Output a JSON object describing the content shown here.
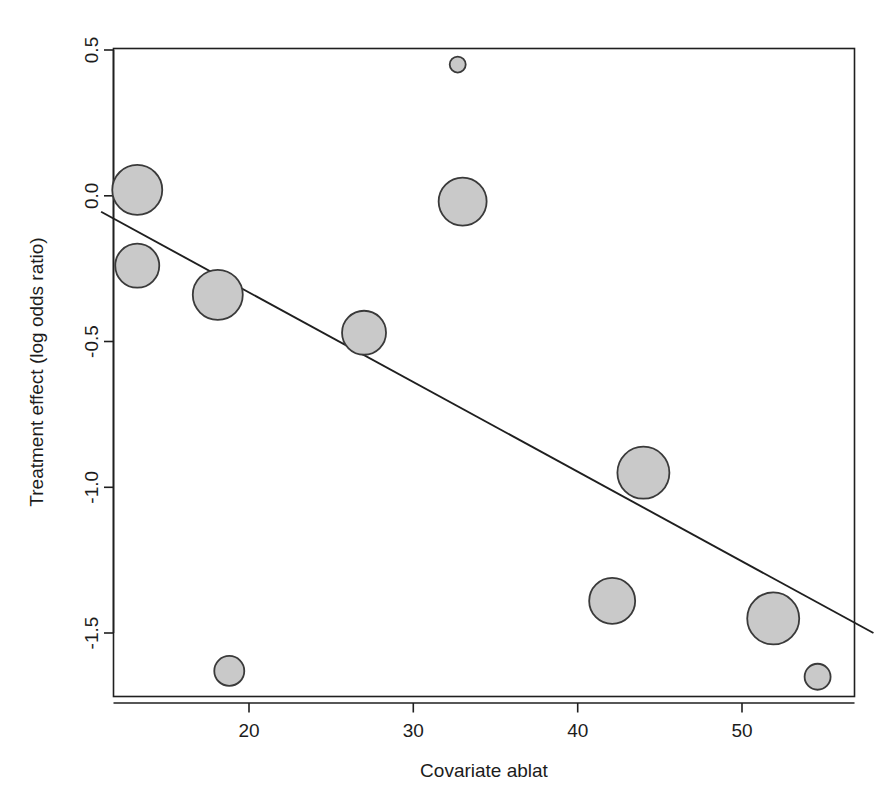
{
  "chart_data": {
    "type": "scatter",
    "title": "",
    "subtitle": "",
    "xlabel": "Covariate ablat",
    "ylabel": "Treatment effect (log odds ratio)",
    "xlim": [
      11.0,
      58.0
    ],
    "ylim": [
      -1.78,
      0.54
    ],
    "xticks": [
      20,
      30,
      40,
      50
    ],
    "xtick_labels": [
      "20",
      "30",
      "40",
      "50"
    ],
    "yticks": [
      0.5,
      0.0,
      -0.5,
      -1.0,
      -1.5
    ],
    "ytick_labels": [
      "0.5",
      "0.0",
      "-0.5",
      "-1.0",
      "-1.5"
    ],
    "grid": false,
    "legend": "none",
    "marker": "filled-circle",
    "marker_fill": "#c9c9c9",
    "marker_edge": "#3a3a3a",
    "size_encoding": "bubble radius proportional to study weight / precision",
    "points": [
      {
        "x": 13.2,
        "y": 0.02,
        "size": 25
      },
      {
        "x": 13.2,
        "y": -0.24,
        "size": 22
      },
      {
        "x": 18.1,
        "y": -0.34,
        "size": 25
      },
      {
        "x": 18.8,
        "y": -1.63,
        "size": 15
      },
      {
        "x": 27.0,
        "y": -0.47,
        "size": 22
      },
      {
        "x": 32.7,
        "y": 0.45,
        "size": 8
      },
      {
        "x": 33.0,
        "y": -0.02,
        "size": 24
      },
      {
        "x": 42.1,
        "y": -1.39,
        "size": 23
      },
      {
        "x": 44.0,
        "y": -0.95,
        "size": 26
      },
      {
        "x": 51.9,
        "y": -1.45,
        "size": 26
      },
      {
        "x": 54.6,
        "y": -1.65,
        "size": 13
      }
    ],
    "fit_line": {
      "name": "meta-regression fit",
      "x_start": 11.0,
      "y_start": -0.055,
      "x_end": 58.0,
      "y_end": -1.5,
      "slope": -0.0308,
      "intercept": 0.284
    }
  },
  "axes": {
    "x_axis_name": "Covariate ablat",
    "y_axis_name": "Treatment effect (log odds ratio)"
  },
  "colors": {
    "bubble_fill": "#c9c9c9",
    "bubble_edge": "#3a3a3a",
    "axis": "#1f1f1f",
    "background": "#ffffff"
  }
}
